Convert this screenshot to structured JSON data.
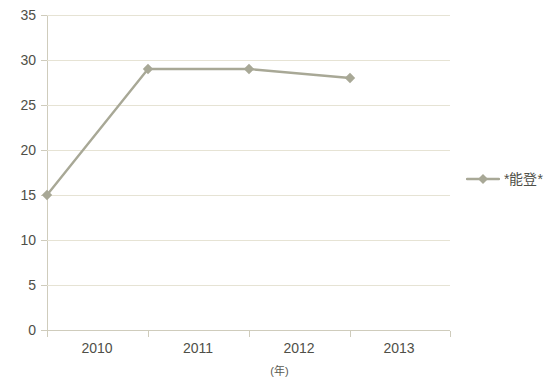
{
  "chart_data": {
    "type": "line",
    "title": "",
    "subtitle": "",
    "xlabel": "(年)",
    "ylabel": "",
    "categories": [
      "2010",
      "2011",
      "2012",
      "2013"
    ],
    "x": [
      2010,
      2011,
      2012,
      2013
    ],
    "series": [
      {
        "name": "*能登*",
        "values": [
          15,
          29,
          29,
          28
        ],
        "color": "#a8a896",
        "marker": "diamond"
      }
    ],
    "ylim": [
      0,
      35
    ],
    "ytick_step": 5,
    "yticks": [
      "0",
      "5",
      "10",
      "15",
      "20",
      "25",
      "30",
      "35"
    ],
    "xticks": [
      "2010",
      "2011",
      "2012",
      "2013"
    ],
    "grid": true,
    "grid_axis": "y",
    "legend": true,
    "legend_position": "right",
    "legend_entries": [
      "*能登*"
    ]
  },
  "axes": {
    "y_tick_labels": [
      "35",
      "30",
      "25",
      "20",
      "15",
      "10",
      "5",
      "0"
    ],
    "x_tick_labels": [
      "2010",
      "2011",
      "2012",
      "2013"
    ],
    "x_axis_title": "(年)"
  },
  "legend": {
    "entries": [
      {
        "label": "*能登*",
        "marker": "diamond-line-marker"
      }
    ]
  },
  "colors": {
    "series_line": "#a8a896",
    "gridline": "#e6e3d4",
    "axis": "#cfccbc",
    "text": "#4f4f48",
    "background": "#ffffff"
  }
}
